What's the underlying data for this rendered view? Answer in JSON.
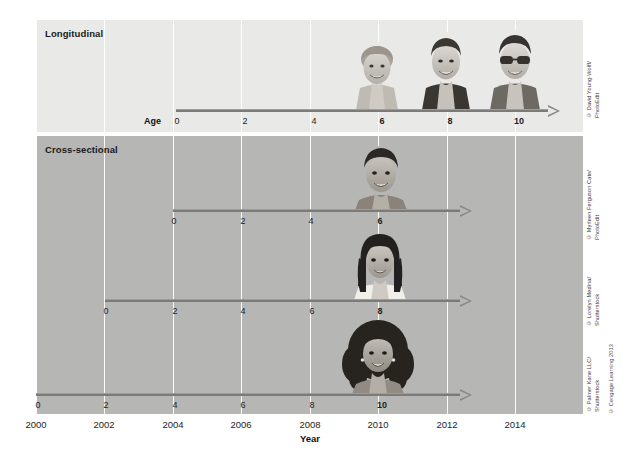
{
  "figure": {
    "panels": [
      {
        "id": "longitudinal",
        "label": "Longitudinal"
      },
      {
        "id": "cross-sectional",
        "label": "Cross-sectional"
      }
    ],
    "age_caption": "Age",
    "year_axis": {
      "title": "Year",
      "labels": [
        "2000",
        "2002",
        "2004",
        "2006",
        "2008",
        "2010",
        "2012",
        "2014"
      ]
    },
    "timelines": [
      {
        "name": "longitudinal-cohort",
        "ticks": [
          "0",
          "2",
          "4",
          "6",
          "8",
          "10"
        ],
        "highlighted": [
          "6",
          "8",
          "10"
        ]
      },
      {
        "name": "cross-sectional-6yr",
        "ticks": [
          "0",
          "2",
          "4",
          "6"
        ],
        "highlighted": [
          "6"
        ]
      },
      {
        "name": "cross-sectional-8yr",
        "ticks": [
          "0",
          "2",
          "4",
          "6",
          "8"
        ],
        "highlighted": [
          "8"
        ]
      },
      {
        "name": "cross-sectional-10yr",
        "ticks": [
          "0",
          "2",
          "4",
          "6",
          "8",
          "10"
        ],
        "highlighted": [
          "10"
        ]
      }
    ],
    "photo_credits": [
      "© David Young-Wolff/\nPhotoEdit",
      "© Myrleen Ferguson Cate/\nPhotoEdit",
      "© Lorelyn Medina/\nShutterstock",
      "© Palmer Kane LLC/\nShutterstock"
    ],
    "publisher_credit": "© Cengage Learning 2013",
    "colors": {
      "panel_light": "#e9e9e7",
      "panel_dark": "#b6b6b4",
      "gridline": "#ffffff",
      "arrow": "#7b7b79",
      "text": "#1e1e1e"
    }
  }
}
